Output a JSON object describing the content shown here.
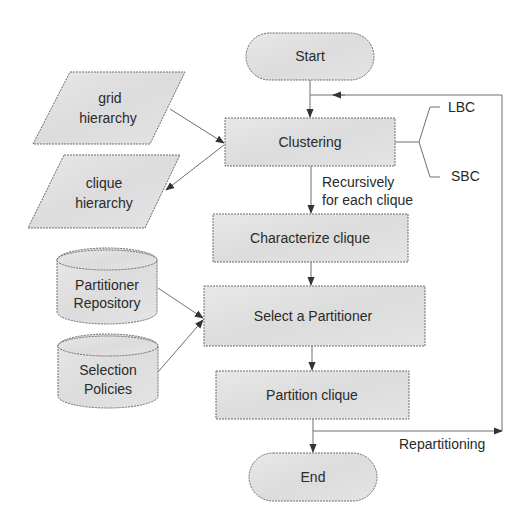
{
  "diagram": {
    "type": "flowchart",
    "colors": {
      "fill": "#e2e2e2",
      "stroke": "#6e6e6e",
      "text": "#2a2a2a",
      "arrow": "#333333"
    },
    "nodes": {
      "start": {
        "label": "Start",
        "shape": "terminator"
      },
      "clustering": {
        "label": "Clustering",
        "shape": "process"
      },
      "characterize": {
        "label": "Characterize clique",
        "shape": "process"
      },
      "select": {
        "label": "Select a Partitioner",
        "shape": "process"
      },
      "partition": {
        "label": "Partition clique",
        "shape": "process"
      },
      "end": {
        "label": "End",
        "shape": "terminator"
      },
      "grid_hierarchy": {
        "line1": "grid",
        "line2": "hierarchy",
        "shape": "data"
      },
      "clique_hierarchy": {
        "line1": "clique",
        "line2": "hierarchy",
        "shape": "data"
      },
      "partitioner_repository": {
        "line1": "Partitioner",
        "line2": "Repository",
        "shape": "database"
      },
      "selection_policies": {
        "line1": "Selection",
        "line2": "Policies",
        "shape": "database"
      }
    },
    "annotations": {
      "lbc": "LBC",
      "sbc": "SBC",
      "recursive_line1": "Recursively",
      "recursive_line2": "for each clique",
      "repartitioning": "Repartitioning"
    },
    "edges": [
      {
        "from": "Start",
        "to": "Clustering"
      },
      {
        "from": "grid hierarchy",
        "to": "Clustering"
      },
      {
        "from": "Clustering",
        "to": "clique hierarchy"
      },
      {
        "from": "Clustering",
        "to": "Characterize clique",
        "label": "Recursively for each clique"
      },
      {
        "from": "Characterize clique",
        "to": "Select a Partitioner"
      },
      {
        "from": "Partitioner Repository",
        "to": "Select a Partitioner"
      },
      {
        "from": "Selection Policies",
        "to": "Select a Partitioner"
      },
      {
        "from": "Select a Partitioner",
        "to": "Partition clique"
      },
      {
        "from": "Partition clique",
        "to": "End"
      },
      {
        "from": "Partition clique",
        "to": "Clustering",
        "label": "Repartitioning"
      }
    ]
  }
}
